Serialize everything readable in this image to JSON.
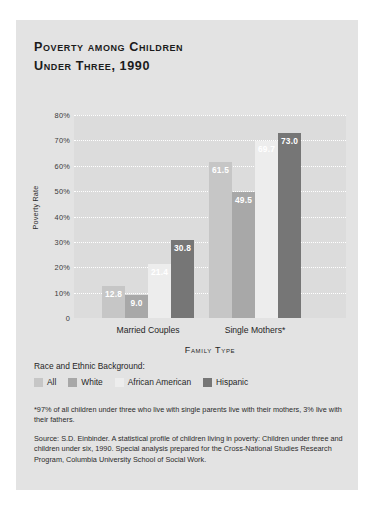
{
  "card": {
    "background": "#e3e3e3"
  },
  "title": {
    "line1": "Poverty among Children",
    "line2": "Under Three, 1990"
  },
  "legend": {
    "heading": "Race and Ethnic Background:",
    "items": [
      {
        "label": "All",
        "color": "#c6c6c6"
      },
      {
        "label": "White",
        "color": "#a8a8a8"
      },
      {
        "label": "African American",
        "color": "#ededed"
      },
      {
        "label": "Hispanic",
        "color": "#767676"
      }
    ]
  },
  "notes": {
    "footnote": "*97% of all children under three who live with single parents live with their mothers, 3% live with their fathers.",
    "source": "Source: S.D. Einbinder. A statistical profile of children living in poverty: Children under three and children under six, 1990. Special analysis prepared for the Cross-National Studies Research Program, Columbia University School of Social Work."
  },
  "chart_data": {
    "type": "bar",
    "title": "Poverty among Children Under Three, 1990",
    "xlabel": "Family Type",
    "ylabel": "Poverty Rate",
    "categories": [
      "Married Couples",
      "Single Mothers*"
    ],
    "series": [
      {
        "name": "All",
        "color": "#c6c6c6",
        "values": [
          12.8,
          61.5
        ]
      },
      {
        "name": "White",
        "color": "#a8a8a8",
        "values": [
          9.0,
          49.5
        ]
      },
      {
        "name": "African American",
        "color": "#ededed",
        "values": [
          21.4,
          69.7
        ]
      },
      {
        "name": "Hispanic",
        "color": "#767676",
        "values": [
          73.0,
          73.0
        ]
      }
    ],
    "hispanic_values": [
      30.8,
      73.0
    ],
    "ylim": [
      0,
      80
    ],
    "yticks": [
      "0",
      "10%",
      "20%",
      "30%",
      "40%",
      "50%",
      "60%",
      "70%",
      "80%"
    ],
    "ytick_values": [
      0,
      10,
      20,
      30,
      40,
      50,
      60,
      70,
      80
    ],
    "grid": true,
    "legend_position": "below",
    "data_labels": [
      "12.8",
      "9.0",
      "21.4",
      "30.8",
      "61.5",
      "49.5",
      "69.7",
      "73.0"
    ],
    "plot_background": "#dcdcdc",
    "gridline_color": "#ffffff"
  }
}
